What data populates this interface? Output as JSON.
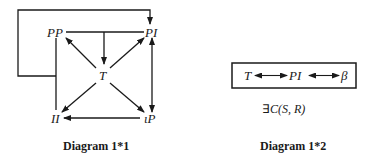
{
  "diagram1": {
    "nodes": {
      "PP": "PP",
      "PI": "PI",
      "T": "T",
      "II": "II",
      "iP": "ιP"
    },
    "caption": "Diagram 1*1",
    "edges": [
      {
        "from": "PP-PI-line",
        "to": "T",
        "type": "arrow"
      },
      {
        "from": "T",
        "to": "PP",
        "type": "arrow"
      },
      {
        "from": "T",
        "to": "PI",
        "type": "arrow"
      },
      {
        "from": "T",
        "to": "II",
        "type": "arrow"
      },
      {
        "from": "T",
        "to": "ιP",
        "type": "arrow"
      },
      {
        "from": "ιP",
        "to": "II",
        "type": "arrow"
      },
      {
        "from": "PI",
        "to": "ιP",
        "type": "bidirectional"
      },
      {
        "from": "PP-II-line",
        "to": "PI",
        "type": "loop-arrow"
      }
    ]
  },
  "diagram2": {
    "nodes": {
      "T": "T",
      "PI": "PI",
      "beta": "β"
    },
    "formula": {
      "exists": "∃",
      "text": "C(S, R)"
    },
    "caption": "Diagram 1*2"
  },
  "colors": {
    "ink": "#1a1a1a",
    "background": "#ffffff"
  }
}
